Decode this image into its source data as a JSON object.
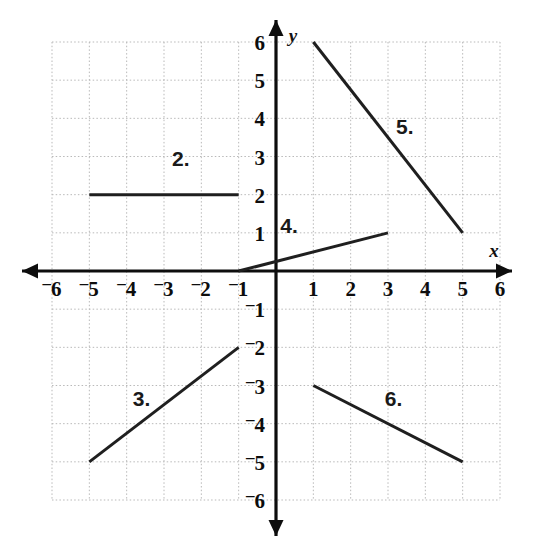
{
  "figure": {
    "kind": "coordinate-plane-line-segments",
    "background_color": "#ffffff",
    "grid_color": "#b9b9b9",
    "axis_color": "#0d0d0d",
    "segment_color": "#1f1f1f",
    "x_axis_label": "x",
    "y_axis_label": "y"
  },
  "axes": {
    "x_ticks": [
      "-6",
      "-5",
      "-4",
      "-3",
      "-2",
      "-1",
      "1",
      "2",
      "3",
      "4",
      "5",
      "6"
    ],
    "y_ticks": [
      "6",
      "5",
      "4",
      "3",
      "2",
      "1",
      "-1",
      "-2",
      "-3",
      "-4",
      "-5",
      "-6"
    ],
    "x_tick_values": [
      -6,
      -5,
      -4,
      -3,
      -2,
      -1,
      1,
      2,
      3,
      4,
      5,
      6
    ],
    "y_tick_values": [
      6,
      5,
      4,
      3,
      2,
      1,
      -1,
      -2,
      -3,
      -4,
      -5,
      -6
    ],
    "minus_glyph": "–"
  },
  "chart_data": {
    "type": "line",
    "title": "",
    "xlabel": "x",
    "ylabel": "y",
    "xlim": [
      -6,
      6
    ],
    "ylim": [
      -6,
      6
    ],
    "grid": true,
    "legend": "none",
    "series": [
      {
        "name": "2.",
        "label": "2.",
        "label_position": {
          "x": -2.55,
          "y": 2.75
        },
        "points": [
          {
            "x": -5,
            "y": 2
          },
          {
            "x": -1,
            "y": 2
          }
        ],
        "slope": 0
      },
      {
        "name": "3.",
        "label": "3.",
        "label_position": {
          "x": -3.6,
          "y": -3.55
        },
        "points": [
          {
            "x": -5,
            "y": -5
          },
          {
            "x": -1,
            "y": -2
          }
        ],
        "slope": 0.75
      },
      {
        "name": "4.",
        "label": "4.",
        "label_position": {
          "x": 0.35,
          "y": 1.0
        },
        "points": [
          {
            "x": -1,
            "y": 0
          },
          {
            "x": 3,
            "y": 1
          }
        ],
        "slope": 0.25
      },
      {
        "name": "5.",
        "label": "5.",
        "label_position": {
          "x": 3.45,
          "y": 3.6
        },
        "points": [
          {
            "x": 1,
            "y": 6
          },
          {
            "x": 5,
            "y": 1
          }
        ],
        "slope": -1.25
      },
      {
        "name": "6.",
        "label": "6.",
        "label_position": {
          "x": 3.15,
          "y": -3.55
        },
        "points": [
          {
            "x": 1,
            "y": -3
          },
          {
            "x": 5,
            "y": -5
          }
        ],
        "slope": -0.5
      }
    ]
  }
}
